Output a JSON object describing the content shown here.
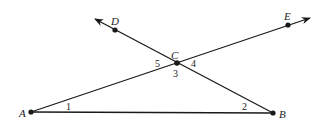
{
  "diagram": {
    "colors": {
      "stroke": "#1a1a1a",
      "text": "#222222",
      "background": "#ffffff"
    },
    "points": {
      "A": {
        "label": "A",
        "x": 31,
        "y": 112
      },
      "B": {
        "label": "B",
        "x": 273,
        "y": 113
      },
      "C": {
        "label": "C",
        "x": 177,
        "y": 63
      },
      "D": {
        "label": "D",
        "x": 115,
        "y": 30
      },
      "E": {
        "label": "E",
        "x": 288,
        "y": 25
      }
    },
    "segments": [
      {
        "from": "A",
        "to": "B",
        "type": "segment"
      },
      {
        "from": "A",
        "to": "E",
        "type": "ray",
        "through": "C"
      },
      {
        "from": "B",
        "to": "D",
        "type": "ray",
        "through": "C"
      }
    ],
    "angle_labels": {
      "a1": "1",
      "a2": "2",
      "a3": "3",
      "a4": "4",
      "a5": "5"
    }
  }
}
